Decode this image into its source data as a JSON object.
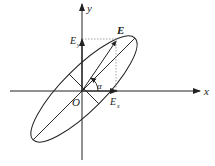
{
  "diagram": {
    "labels": {
      "x_axis": "x",
      "y_axis": "y",
      "origin": "O",
      "vector": "E",
      "ex_main": "E",
      "ex_sub": "x",
      "ey_main": "E",
      "ey_sub": "y",
      "angle": "α"
    },
    "colors": {
      "stroke": "#222222",
      "dotted": "#888888",
      "background": "#ffffff"
    }
  }
}
